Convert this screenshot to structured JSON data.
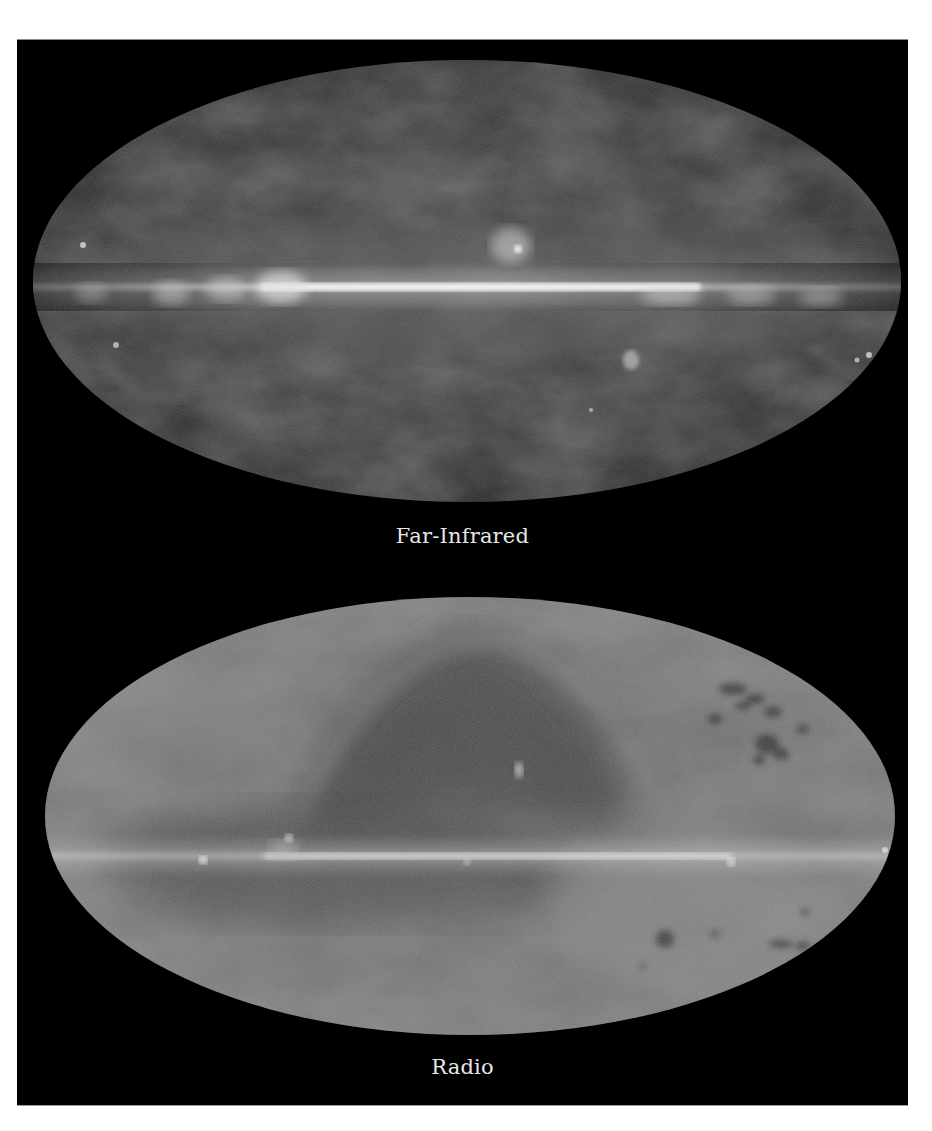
{
  "figure": {
    "background": "#000000",
    "panels": [
      {
        "id": "far-infrared",
        "caption": "Far-Infrared",
        "projection": "mollweide all-sky",
        "tone": "dark grey sky with bright white galactic plane band"
      },
      {
        "id": "radio",
        "caption": "Radio",
        "projection": "mollweide all-sky",
        "tone": "mid grey sky with dark loop arc above centre, bright galactic plane band, dark patches lower right and upper right"
      }
    ],
    "colors": {
      "caption_text": "#e6e6e6",
      "fir_sky": "#2a2a2a",
      "fir_plane": "#f0f0f0",
      "radio_sky": "#6a6a6a",
      "radio_plane": "#dcdcdc"
    }
  }
}
